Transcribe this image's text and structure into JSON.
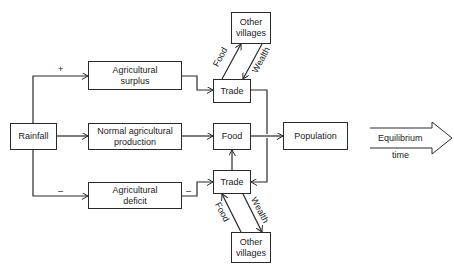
{
  "diagram": {
    "nodes": {
      "rainfall": "Rainfall",
      "surplus_line1": "Agricultural",
      "surplus_line2": "surplus",
      "normal_line1": "Normal agricultural",
      "normal_line2": "production",
      "deficit_line1": "Agricultural",
      "deficit_line2": "deficit",
      "trade_top": "Trade",
      "food": "Food",
      "trade_bottom": "Trade",
      "villages_top_line1": "Other",
      "villages_top_line2": "villages",
      "villages_bottom_line1": "Other",
      "villages_bottom_line2": "villages",
      "population": "Population"
    },
    "edge_labels": {
      "plus": "+",
      "minus_left": "–",
      "minus_right": "–",
      "food_top": "Food",
      "wealth_top": "Wealth",
      "food_bottom": "Food",
      "wealth_bottom": "Wealth"
    },
    "outcome_arrow": {
      "label_top": "Equilibrium",
      "label_bottom": "time"
    },
    "colors": {
      "line": "#2a2a2a",
      "background": "#ffffff"
    }
  }
}
